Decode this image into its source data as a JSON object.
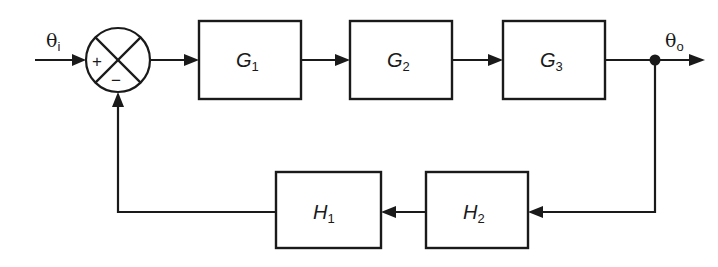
{
  "diagram": {
    "type": "block-diagram",
    "input_signal": {
      "symbol": "θ",
      "subscript": "i"
    },
    "output_signal": {
      "symbol": "θ",
      "subscript": "o"
    },
    "summing_junction": {
      "plus_sign": "+",
      "minus_sign": "−"
    },
    "forward_blocks": [
      {
        "symbol": "G",
        "subscript": "1"
      },
      {
        "symbol": "G",
        "subscript": "2"
      },
      {
        "symbol": "G",
        "subscript": "3"
      }
    ],
    "feedback_blocks": [
      {
        "symbol": "H",
        "subscript": "1"
      },
      {
        "symbol": "H",
        "subscript": "2"
      }
    ],
    "colors": {
      "stroke": "#1a1a1a",
      "background": "#ffffff"
    }
  }
}
